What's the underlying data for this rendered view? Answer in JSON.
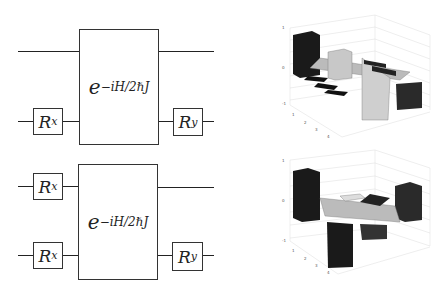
{
  "circuits": [
    {
      "id": "top",
      "left_gates": [
        {
          "qubit": 2,
          "label": "R",
          "sub": "x"
        }
      ],
      "unitary": {
        "base": "e",
        "exponent": "−iH/2ℏJ"
      },
      "right_gates": [
        {
          "qubit": 2,
          "label": "R",
          "sub": "y"
        }
      ]
    },
    {
      "id": "bottom",
      "left_gates": [
        {
          "qubit": 1,
          "label": "R",
          "sub": "x"
        },
        {
          "qubit": 2,
          "label": "R",
          "sub": "x"
        }
      ],
      "unitary": {
        "base": "e",
        "exponent": "−iH/2ℏJ"
      },
      "right_gates": [
        {
          "qubit": 2,
          "label": "R",
          "sub": "y"
        }
      ]
    }
  ],
  "plots": [
    {
      "id": "top-density-matrix",
      "z_ticks": [
        "1",
        "0.8",
        "0.6",
        "0.4",
        "0.2",
        "0",
        "-0.2",
        "-0.4",
        "-0.6",
        "-0.8",
        "-1"
      ],
      "x_ticks": [
        "1",
        "2",
        "3",
        "4"
      ]
    },
    {
      "id": "bottom-density-matrix",
      "z_ticks": [
        "1",
        "0.8",
        "0.6",
        "0.4",
        "0.2",
        "0",
        "-0.2",
        "-0.4",
        "-0.6",
        "-0.8",
        "-1"
      ],
      "x_ticks": [
        "1",
        "2",
        "3",
        "4"
      ]
    }
  ],
  "colors": {
    "dark_bar": "#1a1a1a",
    "light_bar": "#c8c8c8",
    "mid_bar": "#3a3a3a",
    "line": "#222222"
  }
}
